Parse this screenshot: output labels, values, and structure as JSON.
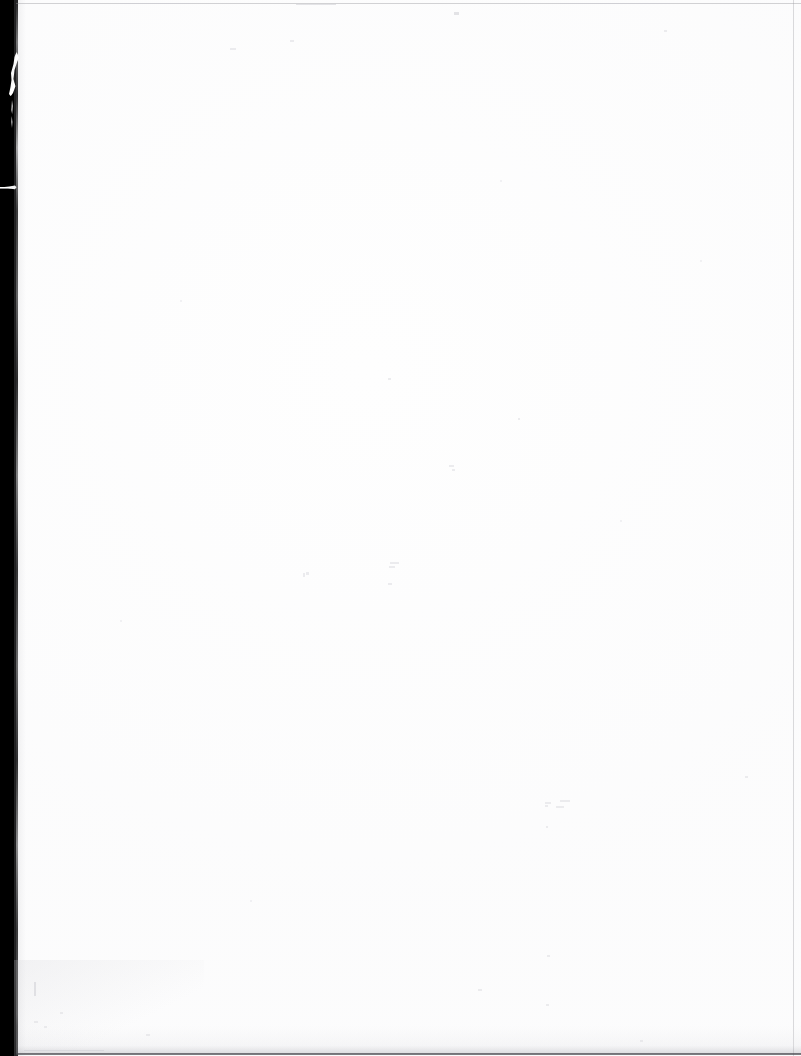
{
  "document": {
    "kind": "scanned-page",
    "page_label": "",
    "body_text": "",
    "is_blank": true,
    "width_px": 801,
    "height_px": 1056
  },
  "colors": {
    "scan_border": "#000000",
    "paper": "#fefefe",
    "paper_shadow": "#c8c8cd",
    "frame_line": "#9a9aa0",
    "bottom_line": "#46464b"
  },
  "artifacts": {
    "left_border_label": "scanner-bed-black-margin",
    "torn_sliver_label": "torn-page-edge-sliver",
    "notch_label": "page-edge-notch",
    "top_line_label": "scan-frame-line-top",
    "right_line_label": "scan-frame-line-right",
    "bottom_line_label": "scan-frame-line-bottom",
    "speckle_label": "scan-dust-speckles"
  },
  "content": {
    "text_blocks": [],
    "figures": [],
    "captions": []
  }
}
